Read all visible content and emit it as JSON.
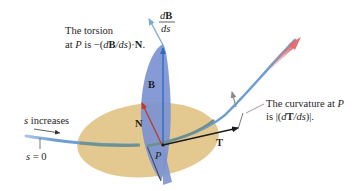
{
  "diagram": {
    "colors": {
      "background": "#ffffff",
      "osculating_plane": "#e3c98f",
      "normal_plane": "#7c93d1",
      "curve": "#6f9fd0",
      "curve_shadowed": "#6f8f8a",
      "vector_B": "#3a78c8",
      "vector_N": "#c0392b",
      "vector_T": "#1a1a1a",
      "vector_dBds": "#7aa8d6",
      "vector_gray": "#8a8a8a",
      "direction_arrow": "#e07a7a",
      "text": "#1e1e1e"
    },
    "labels": {
      "torsion_line1": "The torsion",
      "torsion_line2_prefix": "at ",
      "torsion_P": "P",
      "torsion_line2_mid": " is −(",
      "torsion_d": "d",
      "torsion_B": "B",
      "torsion_ds": "/ds",
      "torsion_close": ")·",
      "torsion_N": "N",
      "torsion_end": ".",
      "dB_num_d": "d",
      "dB_num_B": "B",
      "dB_den": "ds",
      "curvature_line1_prefix": "The curvature at ",
      "curvature_P": "P",
      "curvature_line2_prefix": "is |(",
      "curvature_d": "d",
      "curvature_T": "T",
      "curvature_ds": "/ds",
      "curvature_close": ")|.",
      "s_increases_s": "s",
      "s_increases_text": " increases",
      "s_zero_s": "s",
      "s_zero_text": " = 0",
      "vector_B": "B",
      "vector_N": "N",
      "vector_T": "T",
      "point_P": "P"
    }
  }
}
